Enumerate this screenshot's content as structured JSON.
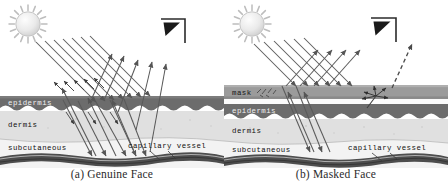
{
  "figure": {
    "type": "diagram",
    "panel_count": 2
  },
  "panels": [
    {
      "id": "a",
      "caption": "(a) Genuine Face",
      "icons": {
        "light_source": "sun-icon",
        "sensor": "camera-icon"
      },
      "layers": [
        {
          "name": "epidermis",
          "label": "epidermis",
          "color": "#6e6e6e",
          "y": 96,
          "h": 15
        },
        {
          "name": "dermis",
          "label": "dermis",
          "color": "#dcdcdc",
          "y": 111,
          "h": 26
        },
        {
          "name": "subcutaneous",
          "label": "subcutaneous",
          "color": "#f0f0f0",
          "y": 137,
          "h": 18
        },
        {
          "name": "capillary",
          "label": "capillary vessel",
          "color": "#4a4a4a",
          "y": 155,
          "h": 12
        }
      ],
      "rays": {
        "incident_label": "incident light",
        "reflected_label": "reflected light",
        "incident_count": 7,
        "reflected_count": 5,
        "style": "solid"
      }
    },
    {
      "id": "b",
      "caption": "(b) Masked Face",
      "icons": {
        "light_source": "sun-icon",
        "sensor": "camera-icon"
      },
      "layers": [
        {
          "name": "mask",
          "label": "mask",
          "color": "#9a9a9a",
          "y": 88,
          "h": 13
        },
        {
          "name": "epidermis",
          "label": "epidermis",
          "color": "#6e6e6e",
          "y": 104,
          "h": 15
        },
        {
          "name": "dermis",
          "label": "dermis",
          "color": "#dcdcdc",
          "y": 119,
          "h": 22
        },
        {
          "name": "subcutaneous",
          "label": "subcutaneous",
          "color": "#f0f0f0",
          "y": 141,
          "h": 15
        },
        {
          "name": "capillary",
          "label": "capillary vessel",
          "color": "#4a4a4a",
          "y": 156,
          "h": 12
        }
      ],
      "rays": {
        "incident_label": "incident light",
        "reflected_label": "reflected light",
        "scattered_label": "scattered light",
        "incident_count": 6,
        "reflected_count": 4,
        "style": "solid + dashed"
      }
    }
  ],
  "colors": {
    "background": "#ffffff",
    "epidermis": "#6e6e6e",
    "dermis": "#dcdcdc",
    "subcutaneous": "#f0f0f0",
    "mask": "#9a9a9a",
    "capillary": "#4a4a4a",
    "ray": "#555555",
    "sun_fill": "#e8e8e8",
    "caption_text": "#2a2a2a"
  }
}
